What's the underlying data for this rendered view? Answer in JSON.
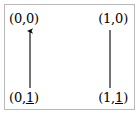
{
  "figure": {
    "kind": "graph-edge-orientation-diagram",
    "border_color": "#b9b9b9",
    "background": "#ffffff",
    "stroke_color": "#000000",
    "vertices": {
      "top_left": {
        "open": "(",
        "first": "0",
        "sep": ",",
        "second": "0",
        "close": ")",
        "underlined_second": false
      },
      "top_right": {
        "open": "(",
        "first": "1",
        "sep": ",",
        "second": "0",
        "close": ")",
        "underlined_second": false
      },
      "bottom_left": {
        "open": "(",
        "first": "0",
        "sep": ",",
        "second": "1",
        "close": ")",
        "underlined_second": true
      },
      "bottom_right": {
        "open": "(",
        "first": "1",
        "sep": ",",
        "second": "1",
        "close": ")",
        "underlined_second": true
      }
    },
    "edges": [
      {
        "name": "left-edge",
        "from": "bottom_left",
        "to": "top_left",
        "x": 30,
        "y_start": 88,
        "y_end": 30,
        "arrowhead": "up"
      },
      {
        "name": "right-edge",
        "from": "bottom_right",
        "to": "top_right",
        "x": 110,
        "y_start": 88,
        "y_end": 30,
        "arrowhead": "none"
      }
    ]
  }
}
